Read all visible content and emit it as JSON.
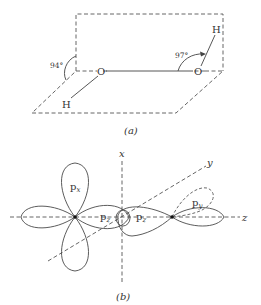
{
  "figure": {
    "part_a": {
      "caption": "(a)",
      "atoms": {
        "oxygen_left": "O",
        "oxygen_right": "O",
        "hydrogen_left": "H",
        "hydrogen_right": "H"
      },
      "angles": {
        "left_dihedral": "94°",
        "right_bond": "97°"
      }
    },
    "part_b": {
      "caption": "(b)",
      "axes": {
        "x": "x",
        "y": "y",
        "z": "z"
      },
      "orbitals": {
        "left_top": "p",
        "left_top_sub": "x",
        "left_right": "p",
        "left_right_sub": "z",
        "right_left": "p",
        "right_left_sub": "z",
        "right_dashed": "p",
        "right_dashed_sub": "y"
      }
    }
  }
}
